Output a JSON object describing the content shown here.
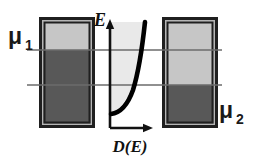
{
  "figure": {
    "kind": "energy-level-diagram",
    "width": 256,
    "height": 162,
    "background": "#ffffff"
  },
  "labels": {
    "mu1": "μ",
    "mu1_sub": "1",
    "mu2": "μ",
    "mu2_sub": "2",
    "energy_axis": "E",
    "dos_axis": "D(E)"
  },
  "colors": {
    "filled_level": "#585858",
    "empty_level": "#c6c6c6",
    "dos_shade": "#e9e9e9",
    "border": "#1f1f1f",
    "border_inner": "#b5b5b5",
    "curve": "#000000",
    "axis": "#111111",
    "level_line": "#6b6b6b"
  },
  "left_lead": {
    "name": "left-reservoir",
    "x": 42,
    "y": 20,
    "width": 50,
    "height": 105,
    "fill_top_y": 50,
    "filled_fraction": 0.71,
    "occupied_color": "#585858",
    "unoccupied_color": "#c6c6c6"
  },
  "right_lead": {
    "name": "right-reservoir",
    "x": 165,
    "y": 20,
    "width": 50,
    "height": 105,
    "fill_top_y": 85,
    "filled_fraction": 0.38,
    "occupied_color": "#585858",
    "unoccupied_color": "#c6c6c6"
  },
  "chemical_potentials": [
    {
      "name": "mu1",
      "label": "μ1",
      "y": 50,
      "x_start": 27,
      "x_end": 222,
      "label_x": 8,
      "label_y": 44
    },
    {
      "name": "mu2",
      "label": "μ2",
      "y": 85,
      "x_start": 27,
      "x_end": 222,
      "label_x": 218,
      "label_y": 118
    }
  ],
  "dos_plot": {
    "origin_x": 110,
    "origin_y": 128,
    "y_axis_top": 22,
    "x_axis_right": 152,
    "curve_description": "density of states rising from band bottom, parabolic / square-root-like",
    "curve_points": [
      {
        "x": 112,
        "y": 113
      },
      {
        "x": 120,
        "y": 108
      },
      {
        "x": 126,
        "y": 99
      },
      {
        "x": 131,
        "y": 86
      },
      {
        "x": 136,
        "y": 70
      },
      {
        "x": 140,
        "y": 52
      },
      {
        "x": 143,
        "y": 36
      },
      {
        "x": 145,
        "y": 22
      }
    ],
    "shade_color": "#e9e9e9",
    "shade_right_edge": 145,
    "shade_top": 22
  }
}
